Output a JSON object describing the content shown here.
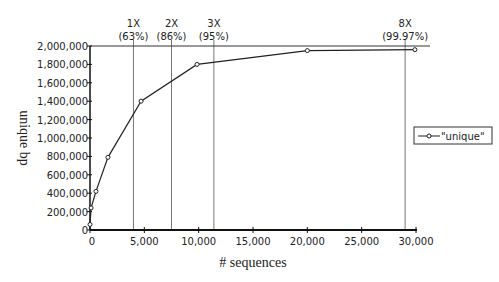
{
  "chart_data": {
    "type": "line",
    "title": "",
    "xlabel": "# sequences",
    "ylabel": "unique bp",
    "xlim": [
      0,
      30000
    ],
    "ylim": [
      0,
      2000000
    ],
    "x_ticks": [
      0,
      5000,
      10000,
      15000,
      20000,
      25000,
      30000
    ],
    "x_tick_labels": [
      "0",
      "5,000",
      "10,000",
      "15,000",
      "20,000",
      "25,000",
      "30,000"
    ],
    "y_ticks": [
      0,
      200000,
      400000,
      600000,
      800000,
      1000000,
      1200000,
      1400000,
      1600000,
      1800000,
      2000000
    ],
    "y_tick_labels": [
      "0",
      "200,000",
      "400,000",
      "600,000",
      "800,000",
      "1,000,000",
      "1,200,000",
      "1,400,000",
      "1,600,000",
      "1,800,000",
      "2,000,000"
    ],
    "grid": false,
    "legend": "right",
    "series": [
      {
        "name": "\"unique\"",
        "x": [
          0,
          100,
          550,
          1650,
          4700,
          9850,
          20000,
          29900
        ],
        "y": [
          60000,
          240000,
          420000,
          790000,
          1400000,
          1800000,
          1950000,
          1960000
        ]
      }
    ],
    "annotations": [
      {
        "x": 4000,
        "line1": "1X",
        "line2": "(63%)"
      },
      {
        "x": 7500,
        "line1": "2X",
        "line2": "(86%)"
      },
      {
        "x": 11400,
        "line1": "3X",
        "line2": "(95%)"
      },
      {
        "x": 29000,
        "line1": "8X",
        "line2": "(99.97%)"
      }
    ]
  }
}
